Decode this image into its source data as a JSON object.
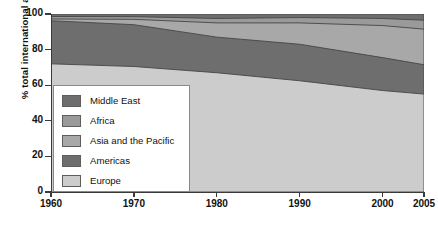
{
  "axes": {
    "ylabel": "% total international arrivals",
    "yticks": [
      "0",
      "20",
      "40",
      "60",
      "80",
      "100"
    ],
    "xticks": [
      "1960",
      "1970",
      "1980",
      "1990",
      "2000",
      "2005"
    ]
  },
  "legend": {
    "items": [
      {
        "label": "Middle East",
        "color": "#6e6e6e"
      },
      {
        "label": "Africa",
        "color": "#9a9a9a"
      },
      {
        "label": "Asia and the Pacific",
        "color": "#a8a8a8"
      },
      {
        "label": "Americas",
        "color": "#6e6e6e"
      },
      {
        "label": "Europe",
        "color": "#cccccc"
      }
    ]
  },
  "chart_data": {
    "type": "area",
    "stacked": true,
    "title": "",
    "xlabel": "",
    "ylabel": "% total international arrivals",
    "xlim": [
      1960,
      2005
    ],
    "ylim": [
      0,
      100
    ],
    "grid": false,
    "legend_position": "inside-lower-left",
    "x": [
      1960,
      1970,
      1980,
      1990,
      2000,
      2005
    ],
    "series": [
      {
        "name": "Europe",
        "color": "#cccccc",
        "values": [
          72.0,
          70.5,
          67.0,
          62.5,
          57.0,
          55.0
        ]
      },
      {
        "name": "Americas",
        "color": "#6e6e6e",
        "values": [
          24.2,
          23.5,
          20.0,
          20.5,
          18.5,
          16.5
        ]
      },
      {
        "name": "Asia and the Pacific",
        "color": "#a8a8a8",
        "values": [
          1.0,
          3.0,
          8.0,
          12.0,
          18.0,
          20.0
        ]
      },
      {
        "name": "Africa",
        "color": "#9a9a9a",
        "values": [
          1.4,
          1.5,
          2.5,
          3.0,
          4.0,
          5.0
        ]
      },
      {
        "name": "Middle East",
        "color": "#6e6e6e",
        "values": [
          1.4,
          1.5,
          2.5,
          2.0,
          2.5,
          3.5
        ]
      }
    ],
    "cumulative_tops": {
      "Europe": [
        72.0,
        70.5,
        67.0,
        62.5,
        57.0,
        55.0
      ],
      "Americas": [
        96.2,
        94.0,
        87.0,
        83.0,
        75.5,
        71.5
      ],
      "Asia and the Pacific": [
        97.2,
        97.0,
        95.0,
        95.0,
        93.5,
        91.5
      ],
      "Africa": [
        98.6,
        98.5,
        97.5,
        98.0,
        97.5,
        96.5
      ],
      "Middle East": [
        100.0,
        100.0,
        100.0,
        100.0,
        100.0,
        100.0
      ]
    }
  }
}
